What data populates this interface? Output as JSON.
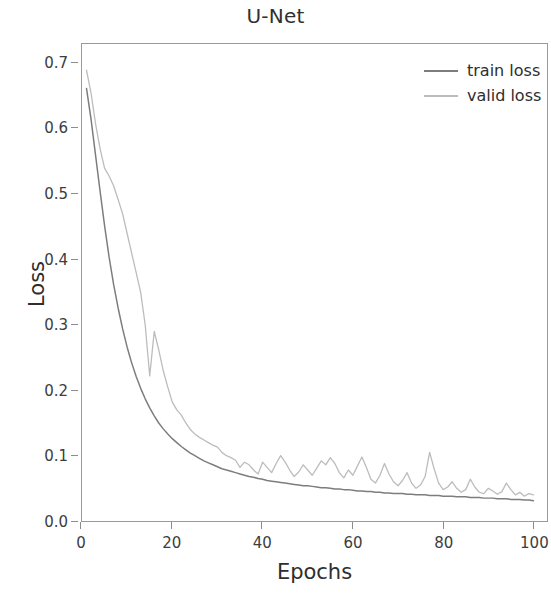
{
  "chart_data": {
    "type": "line",
    "title": "U-Net",
    "xlabel": "Epochs",
    "ylabel": "Loss",
    "xlim": [
      0,
      103
    ],
    "ylim": [
      0.0,
      0.73
    ],
    "xticks": [
      0,
      20,
      40,
      60,
      80,
      100
    ],
    "xtick_labels": [
      "0",
      "20",
      "40",
      "60",
      "80",
      "100"
    ],
    "yticks": [
      0.0,
      0.1,
      0.2,
      0.3,
      0.4,
      0.5,
      0.6,
      0.7
    ],
    "ytick_labels": [
      "0.0",
      "0.1",
      "0.2",
      "0.3",
      "0.4",
      "0.5",
      "0.6",
      "0.7"
    ],
    "grid": false,
    "legend_position": "top-right",
    "colors": {
      "train_loss": "#7d7d7d",
      "valid_loss": "#bcbcbc",
      "axis": "#9a9a9a",
      "text": "#2e2e2e",
      "background": "#ffffff"
    },
    "x": [
      1,
      2,
      3,
      4,
      5,
      6,
      7,
      8,
      9,
      10,
      11,
      12,
      13,
      14,
      15,
      16,
      17,
      18,
      19,
      20,
      21,
      22,
      23,
      24,
      25,
      26,
      27,
      28,
      29,
      30,
      31,
      32,
      33,
      34,
      35,
      36,
      37,
      38,
      39,
      40,
      41,
      42,
      43,
      44,
      45,
      46,
      47,
      48,
      49,
      50,
      51,
      52,
      53,
      54,
      55,
      56,
      57,
      58,
      59,
      60,
      61,
      62,
      63,
      64,
      65,
      66,
      67,
      68,
      69,
      70,
      71,
      72,
      73,
      74,
      75,
      76,
      77,
      78,
      79,
      80,
      81,
      82,
      83,
      84,
      85,
      86,
      87,
      88,
      89,
      90,
      91,
      92,
      93,
      94,
      95,
      96,
      97,
      98,
      99,
      100
    ],
    "series": [
      {
        "name": "train loss",
        "color": "#7d7d7d",
        "values": [
          0.662,
          0.615,
          0.56,
          0.505,
          0.452,
          0.404,
          0.362,
          0.326,
          0.294,
          0.266,
          0.242,
          0.221,
          0.203,
          0.187,
          0.173,
          0.161,
          0.15,
          0.141,
          0.133,
          0.126,
          0.12,
          0.114,
          0.109,
          0.104,
          0.1,
          0.096,
          0.092,
          0.089,
          0.086,
          0.083,
          0.08,
          0.078,
          0.076,
          0.074,
          0.072,
          0.07,
          0.068,
          0.067,
          0.065,
          0.064,
          0.062,
          0.061,
          0.06,
          0.059,
          0.058,
          0.057,
          0.056,
          0.055,
          0.054,
          0.054,
          0.053,
          0.052,
          0.051,
          0.051,
          0.05,
          0.049,
          0.049,
          0.048,
          0.048,
          0.047,
          0.046,
          0.046,
          0.045,
          0.045,
          0.044,
          0.044,
          0.043,
          0.043,
          0.042,
          0.042,
          0.042,
          0.041,
          0.041,
          0.04,
          0.04,
          0.04,
          0.039,
          0.039,
          0.039,
          0.038,
          0.038,
          0.038,
          0.037,
          0.037,
          0.037,
          0.036,
          0.036,
          0.036,
          0.035,
          0.035,
          0.035,
          0.034,
          0.034,
          0.034,
          0.033,
          0.033,
          0.033,
          0.032,
          0.032,
          0.031
        ]
      },
      {
        "name": "valid loss",
        "color": "#bcbcbc",
        "values": [
          0.69,
          0.655,
          0.608,
          0.57,
          0.54,
          0.528,
          0.513,
          0.492,
          0.47,
          0.44,
          0.41,
          0.38,
          0.35,
          0.3,
          0.222,
          0.29,
          0.262,
          0.23,
          0.205,
          0.182,
          0.17,
          0.162,
          0.15,
          0.14,
          0.133,
          0.128,
          0.124,
          0.12,
          0.116,
          0.113,
          0.105,
          0.1,
          0.097,
          0.093,
          0.082,
          0.09,
          0.086,
          0.078,
          0.072,
          0.09,
          0.082,
          0.074,
          0.088,
          0.1,
          0.09,
          0.078,
          0.068,
          0.075,
          0.086,
          0.078,
          0.07,
          0.081,
          0.092,
          0.086,
          0.097,
          0.088,
          0.074,
          0.066,
          0.078,
          0.07,
          0.084,
          0.098,
          0.082,
          0.064,
          0.058,
          0.07,
          0.088,
          0.072,
          0.06,
          0.054,
          0.062,
          0.074,
          0.058,
          0.05,
          0.055,
          0.068,
          0.105,
          0.08,
          0.058,
          0.048,
          0.052,
          0.06,
          0.05,
          0.044,
          0.048,
          0.064,
          0.052,
          0.044,
          0.042,
          0.05,
          0.046,
          0.041,
          0.045,
          0.058,
          0.048,
          0.04,
          0.044,
          0.038,
          0.042,
          0.04
        ]
      }
    ]
  },
  "legend": {
    "items": [
      {
        "label": "train loss"
      },
      {
        "label": "valid loss"
      }
    ]
  }
}
